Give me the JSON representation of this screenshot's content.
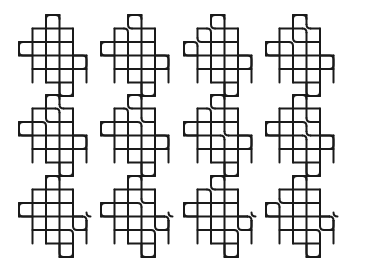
{
  "figure": {
    "rows": 3,
    "columns": 4,
    "stroke_color": "#1a1a1a",
    "background": "#ffffff"
  },
  "knots": [
    {
      "id": "knot-1",
      "row": 0,
      "col": 0,
      "smoothings": []
    },
    {
      "id": "knot-2",
      "row": 0,
      "col": 1,
      "smoothings": [
        [
          2,
          1
        ]
      ]
    },
    {
      "id": "knot-3",
      "row": 0,
      "col": 2,
      "smoothings": [
        [
          1,
          2
        ],
        [
          2,
          1
        ]
      ]
    },
    {
      "id": "knot-4",
      "row": 0,
      "col": 3,
      "smoothings": [
        [
          2,
          2
        ],
        [
          3,
          1
        ]
      ]
    },
    {
      "id": "knot-5",
      "row": 1,
      "col": 0,
      "smoothings": [
        [
          2,
          2
        ],
        [
          3,
          1
        ]
      ]
    },
    {
      "id": "knot-6",
      "row": 1,
      "col": 1,
      "smoothings": [
        [
          2,
          1
        ],
        [
          3,
          2
        ]
      ]
    },
    {
      "id": "knot-7",
      "row": 1,
      "col": 2,
      "smoothings": [
        [
          2,
          1
        ],
        [
          3,
          3
        ]
      ]
    },
    {
      "id": "knot-8",
      "row": 1,
      "col": 3,
      "smoothings": [
        [
          3,
          2
        ],
        [
          3,
          3
        ]
      ]
    },
    {
      "id": "knot-9",
      "row": 2,
      "col": 0,
      "smoothings": [
        [
          4,
          4
        ],
        [
          5,
          3
        ]
      ]
    },
    {
      "id": "knot-10",
      "row": 2,
      "col": 1,
      "smoothings": [
        [
          3,
          2
        ],
        [
          4,
          4
        ],
        [
          5,
          3
        ]
      ]
    },
    {
      "id": "knot-11",
      "row": 2,
      "col": 2,
      "smoothings": [
        [
          2,
          1
        ],
        [
          4,
          4
        ],
        [
          5,
          3
        ]
      ]
    },
    {
      "id": "knot-12",
      "row": 2,
      "col": 3,
      "smoothings": [
        [
          1,
          2
        ],
        [
          4,
          4
        ],
        [
          5,
          3
        ]
      ]
    }
  ]
}
